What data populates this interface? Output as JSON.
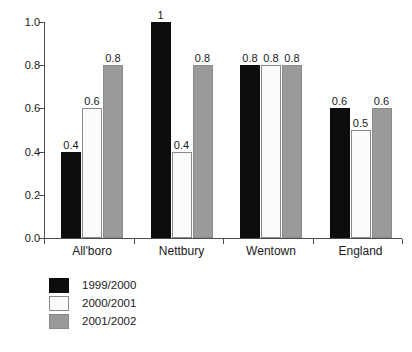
{
  "chart_data": {
    "type": "bar",
    "title": "",
    "subtitle": "",
    "xlabel": "",
    "ylabel": "",
    "categories": [
      "All'boro",
      "Nettbury",
      "Wentown",
      "England"
    ],
    "series": [
      {
        "name": "1999/2000",
        "color": "#0d0d0d",
        "values": [
          0.4,
          1.0,
          0.8,
          0.6
        ],
        "labels": [
          "0.4",
          "1",
          "0.8",
          "0.6"
        ]
      },
      {
        "name": "2000/2001",
        "color": "#fbfbfb",
        "values": [
          0.6,
          0.4,
          0.8,
          0.5
        ],
        "labels": [
          "0.6",
          "0.4",
          "0.8",
          "0.5"
        ]
      },
      {
        "name": "2001/2002",
        "color": "#9a9a9a",
        "values": [
          0.8,
          0.8,
          0.8,
          0.6
        ],
        "labels": [
          "0.8",
          "0.8",
          "0.8",
          "0.6"
        ]
      }
    ],
    "ylim": [
      0.0,
      1.0
    ],
    "yticks": [
      0.0,
      0.2,
      0.4,
      0.6,
      0.8,
      1.0
    ],
    "ytick_labels": [
      "0.0",
      "0.2",
      "0.4",
      "0.6",
      "0.8",
      "1.0"
    ],
    "grid": false,
    "legend_position": "bottom-left",
    "data_labels_shown": true
  },
  "axes": {
    "y_tick_labels": [
      "1.0",
      "0.8",
      "0.6",
      "0.4",
      "0.2",
      "0.0"
    ],
    "x_tick_labels": [
      "All'boro",
      "Nettbury",
      "Wentown",
      "England"
    ]
  },
  "legend": {
    "items": [
      {
        "label": "1999/2000",
        "swatch": "black-swatch"
      },
      {
        "label": "2000/2001",
        "swatch": "white-swatch"
      },
      {
        "label": "2001/2002",
        "swatch": "gray-swatch"
      }
    ]
  }
}
